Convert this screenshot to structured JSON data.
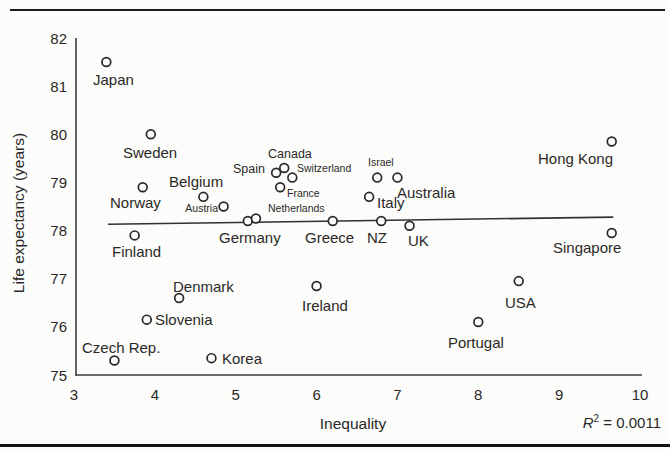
{
  "style": {
    "ink": "#2b2927",
    "axis_color": "#3e3c3a",
    "background": "#fcfcfa",
    "rule_color": "#1d1b1a"
  },
  "chart_data": {
    "type": "scatter",
    "title": "",
    "xlabel": "Inequality",
    "ylabel": "Life expectancy (years)",
    "xlim": [
      3,
      10
    ],
    "ylim": [
      75,
      82
    ],
    "xticks": [
      3,
      4,
      5,
      6,
      7,
      8,
      9,
      10
    ],
    "yticks": [
      75,
      76,
      77,
      78,
      79,
      80,
      81,
      82
    ],
    "grid": false,
    "legend": false,
    "marker": "open-circle",
    "annotation": {
      "text": "R² = 0.0011",
      "symbol": "R",
      "superscript": "2",
      "rest": " = 0.0011"
    },
    "trend_line": {
      "x1": 3.42,
      "y1": 78.13,
      "x2": 9.67,
      "y2": 78.28
    },
    "points": [
      {
        "label": "Japan",
        "x": 3.4,
        "y": 81.5,
        "label_px": 93,
        "label_py": 85,
        "label_size": "lg",
        "anchor": "start"
      },
      {
        "label": "Sweden",
        "x": 3.95,
        "y": 80.0,
        "label_px": 123,
        "label_py": 158,
        "label_size": "lg",
        "anchor": "start"
      },
      {
        "label": "Norway",
        "x": 3.85,
        "y": 78.9,
        "label_px": 110,
        "label_py": 208,
        "label_size": "lg",
        "anchor": "start"
      },
      {
        "label": "Belgium",
        "x": 4.6,
        "y": 78.7,
        "label_px": 169,
        "label_py": 187,
        "label_size": "lg",
        "anchor": "start"
      },
      {
        "label": "Austria",
        "x": 4.85,
        "y": 78.5,
        "label_px": 218,
        "label_py": 212,
        "label_size": "sm",
        "anchor": "end"
      },
      {
        "label": "Finland",
        "x": 3.75,
        "y": 77.9,
        "label_px": 112,
        "label_py": 257,
        "label_size": "lg",
        "anchor": "start"
      },
      {
        "label": "Germany",
        "x": 5.15,
        "y": 78.2,
        "label_px": 219,
        "label_py": 243,
        "label_size": "lg",
        "anchor": "start"
      },
      {
        "label": "Netherlands",
        "x": 5.25,
        "y": 78.25,
        "label_px": 268,
        "label_py": 212,
        "label_size": "sm",
        "anchor": "start"
      },
      {
        "label": "Spain",
        "x": 5.5,
        "y": 79.2,
        "label_px": 265,
        "label_py": 173,
        "label_size": "md",
        "anchor": "end"
      },
      {
        "label": "Canada",
        "x": 5.6,
        "y": 79.3,
        "label_px": 268,
        "label_py": 158,
        "label_size": "md",
        "anchor": "start"
      },
      {
        "label": "Switzerland",
        "x": 5.7,
        "y": 79.1,
        "label_px": 297,
        "label_py": 172,
        "label_size": "sm",
        "anchor": "start"
      },
      {
        "label": "France",
        "x": 5.55,
        "y": 78.9,
        "label_px": 287,
        "label_py": 197,
        "label_size": "sm",
        "anchor": "start"
      },
      {
        "label": "Greece",
        "x": 6.2,
        "y": 78.2,
        "label_px": 305,
        "label_py": 243,
        "label_size": "lg",
        "anchor": "start"
      },
      {
        "label": "Ireland",
        "x": 6.0,
        "y": 76.85,
        "label_px": 302,
        "label_py": 311,
        "label_size": "lg",
        "anchor": "start"
      },
      {
        "label": "Israel",
        "x": 6.75,
        "y": 79.1,
        "label_px": 368,
        "label_py": 166,
        "label_size": "sm",
        "anchor": "start"
      },
      {
        "label": "Italy",
        "x": 6.65,
        "y": 78.7,
        "label_px": 377,
        "label_py": 208,
        "label_size": "lg",
        "anchor": "start"
      },
      {
        "label": "Australia",
        "x": 7.0,
        "y": 79.1,
        "label_px": 397,
        "label_py": 198,
        "label_size": "lg",
        "anchor": "start"
      },
      {
        "label": "NZ",
        "x": 6.8,
        "y": 78.2,
        "label_px": 367,
        "label_py": 243,
        "label_size": "lg",
        "anchor": "start"
      },
      {
        "label": "UK",
        "x": 7.15,
        "y": 78.1,
        "label_px": 408,
        "label_py": 246,
        "label_size": "lg",
        "anchor": "start"
      },
      {
        "label": "Denmark",
        "x": 4.3,
        "y": 76.6,
        "label_px": 173,
        "label_py": 292,
        "label_size": "lg",
        "anchor": "start"
      },
      {
        "label": "Slovenia",
        "x": 3.9,
        "y": 76.15,
        "label_px": 155,
        "label_py": 325,
        "label_size": "lg",
        "anchor": "start"
      },
      {
        "label": "Czech Rep.",
        "x": 3.5,
        "y": 75.3,
        "label_px": 82,
        "label_py": 353,
        "label_size": "lg",
        "anchor": "start"
      },
      {
        "label": "Korea",
        "x": 4.7,
        "y": 75.35,
        "label_px": 222,
        "label_py": 364,
        "label_size": "lg",
        "anchor": "start"
      },
      {
        "label": "Portugal",
        "x": 8.0,
        "y": 76.1,
        "label_px": 448,
        "label_py": 348,
        "label_size": "lg",
        "anchor": "start"
      },
      {
        "label": "USA",
        "x": 8.5,
        "y": 76.95,
        "label_px": 505,
        "label_py": 308,
        "label_size": "lg",
        "anchor": "start"
      },
      {
        "label": "Singapore",
        "x": 9.65,
        "y": 77.95,
        "label_px": 553,
        "label_py": 253,
        "label_size": "lg",
        "anchor": "start"
      },
      {
        "label": "Hong Kong",
        "x": 9.65,
        "y": 79.85,
        "label_px": 538,
        "label_py": 164,
        "label_size": "lg",
        "anchor": "start"
      }
    ]
  }
}
